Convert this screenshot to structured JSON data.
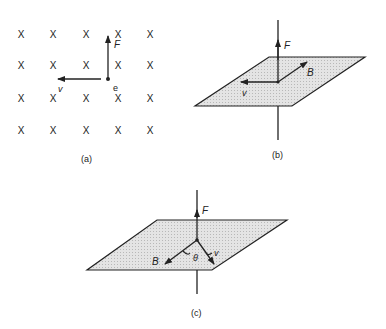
{
  "panels": {
    "a": {
      "caption": "(a)",
      "field_symbol": "X",
      "grid": {
        "rows": 4,
        "cols": 5
      },
      "charge_label": "e",
      "force_label": "F",
      "velocity_label": "v"
    },
    "b": {
      "caption": "(b)",
      "force_label": "F",
      "field_label": "B",
      "velocity_label": "v"
    },
    "c": {
      "caption": "(c)",
      "force_label": "F",
      "field_label": "B",
      "velocity_label": "v",
      "angle_label": "θ"
    }
  },
  "colors": {
    "line": "#222222",
    "plane_fill": "#d6d6d6"
  }
}
